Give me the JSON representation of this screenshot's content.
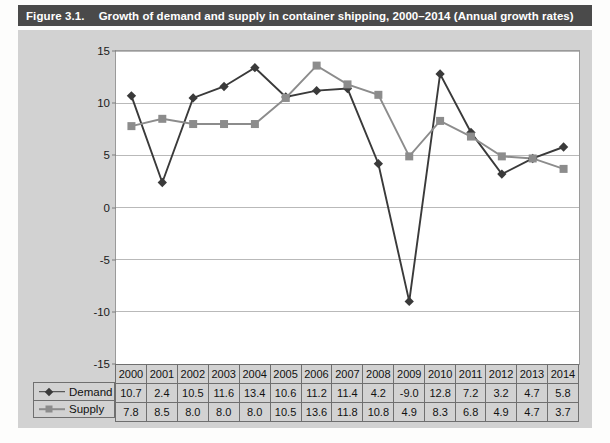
{
  "figure": {
    "number": "Figure 3.1.",
    "title": "Growth of demand and supply in container shipping, 2000–2014 (Annual growth rates)"
  },
  "legend": {
    "demand_label": "Demand",
    "supply_label": "Supply"
  },
  "colors": {
    "title_bar_bg": "#4a4a4a",
    "title_bar_text": "#ffffff",
    "panel_bg": "#d2d2d2",
    "plot_bg": "#ffffff",
    "gridline": "#b9b9b9",
    "demand_series": "#3a3a3a",
    "supply_series": "#8c8c8c",
    "table_border": "#6f6f6f"
  },
  "chart_data": {
    "type": "line",
    "title": "Growth of demand and supply in container shipping, 2000–2014 (Annual growth rates)",
    "xlabel": "",
    "ylabel": "",
    "ylim": [
      -15,
      15
    ],
    "yticks": [
      15,
      10,
      5,
      0,
      -5,
      -10,
      -15
    ],
    "ytick_labels": [
      "15",
      "10",
      "5",
      "0",
      "-5",
      "-10",
      "-15"
    ],
    "grid": true,
    "legend_position": "bottom-left",
    "categories": [
      "2000",
      "2001",
      "2002",
      "2003",
      "2004",
      "2005",
      "2006",
      "2007",
      "2008",
      "2009",
      "2010",
      "2011",
      "2012",
      "2013",
      "2014"
    ],
    "series": [
      {
        "name": "Demand",
        "marker": "diamond",
        "color": "#3a3a3a",
        "values": [
          10.7,
          2.4,
          10.5,
          11.6,
          13.4,
          10.6,
          11.2,
          11.4,
          4.2,
          -9.0,
          12.8,
          7.2,
          3.2,
          4.7,
          5.8
        ],
        "labels": [
          "10.7",
          "2.4",
          "10.5",
          "11.6",
          "13.4",
          "10.6",
          "11.2",
          "11.4",
          "4.2",
          "-9.0",
          "12.8",
          "7.2",
          "3.2",
          "4.7",
          "5.8"
        ]
      },
      {
        "name": "Supply",
        "marker": "square",
        "color": "#8c8c8c",
        "values": [
          7.8,
          8.5,
          8.0,
          8.0,
          8.0,
          10.5,
          13.6,
          11.8,
          10.8,
          4.9,
          8.3,
          6.8,
          4.9,
          4.7,
          3.7
        ],
        "labels": [
          "7.8",
          "8.5",
          "8.0",
          "8.0",
          "8.0",
          "10.5",
          "13.6",
          "11.8",
          "10.8",
          "4.9",
          "8.3",
          "6.8",
          "4.9",
          "4.7",
          "3.7"
        ]
      }
    ]
  }
}
